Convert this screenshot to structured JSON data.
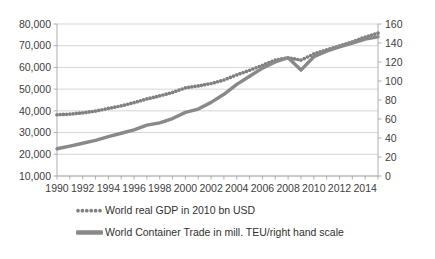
{
  "chart_data": {
    "type": "line",
    "title": "",
    "xlabel": "",
    "ylabel": "",
    "grid": true,
    "legend_position": "bottom",
    "x": [
      1990,
      1991,
      1992,
      1993,
      1994,
      1995,
      1996,
      1997,
      1998,
      1999,
      2000,
      2001,
      2002,
      2003,
      2004,
      2005,
      2006,
      2007,
      2008,
      2009,
      2010,
      2011,
      2012,
      2013,
      2014,
      2015
    ],
    "xtick_labels": [
      "1990",
      "1992",
      "1994",
      "1996",
      "1998",
      "2000",
      "2002",
      "2004",
      "2006",
      "2008",
      "2010",
      "2012",
      "2014"
    ],
    "xtick_values": [
      1990,
      1992,
      1994,
      1996,
      1998,
      2000,
      2002,
      2004,
      2006,
      2008,
      2010,
      2012,
      2014
    ],
    "xlim": [
      1990,
      2015
    ],
    "left_axis": {
      "label": "",
      "ylim": [
        10000,
        80000
      ],
      "ticks": [
        10000,
        20000,
        30000,
        40000,
        50000,
        60000,
        70000,
        80000
      ],
      "tick_labels": [
        "10,000",
        "20,000",
        "30,000",
        "40,000",
        "50,000",
        "60,000",
        "70,000",
        "80,000"
      ]
    },
    "right_axis": {
      "label": "",
      "ylim": [
        0,
        160
      ],
      "ticks": [
        0,
        20,
        40,
        60,
        80,
        100,
        120,
        140,
        160
      ],
      "tick_labels": [
        "0",
        "20",
        "40",
        "60",
        "80",
        "100",
        "120",
        "140",
        "160"
      ]
    },
    "series": [
      {
        "name": "World real GDP in 2010 bn USD",
        "axis": "left",
        "style": "dotted",
        "color": "#808080",
        "values": [
          38200,
          38500,
          39100,
          39900,
          41100,
          42300,
          43800,
          45500,
          46900,
          48500,
          50600,
          51500,
          52600,
          54200,
          56600,
          58700,
          61000,
          63400,
          64400,
          63400,
          66200,
          68100,
          69900,
          71800,
          74000,
          75800
        ]
      },
      {
        "name": "World Container Trade in mill. TEU/right hand scale",
        "axis": "right",
        "style": "solid",
        "color": "#898989",
        "values": [
          28.7,
          31.5,
          34.5,
          37.5,
          41.5,
          45.0,
          48.5,
          53.5,
          56.0,
          60.5,
          67.0,
          70.5,
          77.5,
          86.0,
          96.5,
          105.0,
          113.5,
          120.0,
          124.5,
          111.5,
          125.5,
          131.5,
          136.0,
          140.0,
          144.0,
          146.5
        ]
      }
    ],
    "legend": [
      {
        "label": "World real GDP in 2010 bn USD",
        "marker": "dotted-swatch",
        "color": "#808080"
      },
      {
        "label": "World Container Trade in mill. TEU/right hand scale",
        "marker": "solid-bar",
        "color": "#898989"
      }
    ]
  }
}
